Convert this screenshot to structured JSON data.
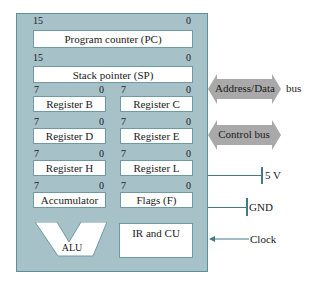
{
  "cpu": {
    "pc": {
      "label": "Program counter (PC)",
      "msb": "15",
      "lsb": "0"
    },
    "sp": {
      "label": "Stack pointer (SP)",
      "msb": "15",
      "lsb": "0"
    },
    "registers": [
      {
        "label": "Register B",
        "msb": "7",
        "lsb": "0"
      },
      {
        "label": "Register C",
        "msb": "7",
        "lsb": "0"
      },
      {
        "label": "Register D",
        "msb": "7",
        "lsb": "0"
      },
      {
        "label": "Register E",
        "msb": "7",
        "lsb": "0"
      },
      {
        "label": "Register H",
        "msb": "7",
        "lsb": "0"
      },
      {
        "label": "Register L",
        "msb": "7",
        "lsb": "0"
      },
      {
        "label": "Accumulator",
        "msb": "7",
        "lsb": "0"
      },
      {
        "label": "Flags (F)",
        "msb": "7",
        "lsb": "0"
      }
    ],
    "alu": "ALU",
    "ircu": "IR and CU"
  },
  "external": {
    "address_data_bus": "Address/Data",
    "bus_suffix": "bus",
    "control_bus": "Control bus",
    "power": "5 V",
    "ground": "GND",
    "clock": "Clock"
  },
  "colors": {
    "cpu_fill": "#a7c1c9",
    "bus_arrow": "#a9a9a9",
    "wire": "#3f7c86"
  }
}
